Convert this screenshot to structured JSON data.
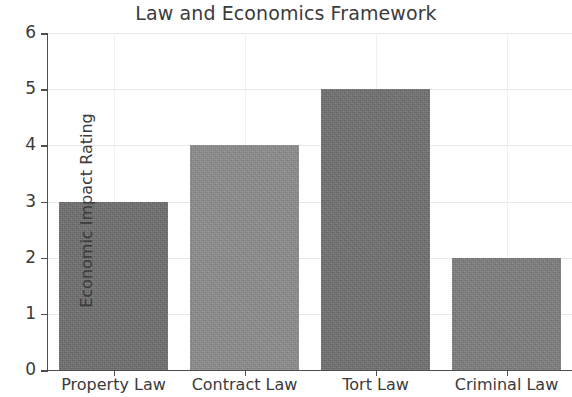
{
  "chart_data": {
    "type": "bar",
    "title": "Law and Economics Framework",
    "xlabel": "",
    "ylabel": "Economic Impact Rating",
    "categories": [
      "Property Law",
      "Contract Law",
      "Tort Law",
      "Criminal Law"
    ],
    "values": [
      3,
      4,
      5,
      2
    ],
    "bar_colors": [
      "#6e6e6e",
      "#8c8c8c",
      "#707070",
      "#7d7d7d"
    ],
    "ylim": [
      0,
      6
    ],
    "yticks": [
      0,
      1,
      2,
      3,
      4,
      5,
      6
    ],
    "ytick_labels": [
      "0",
      "1",
      "2",
      "3",
      "4",
      "5",
      "6"
    ],
    "grid": true,
    "grid_color": "#e9e9e9",
    "legend": null,
    "legend_position": "none",
    "title_color": "#3b3b3b",
    "axis_color": "#4d4d4d",
    "background_color": "#ffffff"
  }
}
